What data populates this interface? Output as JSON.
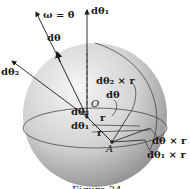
{
  "figure": {
    "labels": {
      "omega": "ω = θ̇",
      "dtheta": "dθ",
      "dtheta1": "dθ₁",
      "dtheta2": "dθ₂",
      "origin": "O",
      "point": "A",
      "dtheta2_cross_r": "dθ₂ × r",
      "dtheta_cross_r": "dθ × r",
      "dtheta1_cross_r": "dθ₁ × r",
      "small_dtheta": "dθ",
      "small_dtheta2": "dθ₂",
      "small_dtheta1": "dθ₁",
      "r_upper": "r",
      "r_lower": "r"
    },
    "caption": "Figure 34"
  },
  "colors": {
    "sphere_light": "#f4f4f4",
    "sphere_dark": "#8a8a8a",
    "ink": "#1a1a1a"
  }
}
